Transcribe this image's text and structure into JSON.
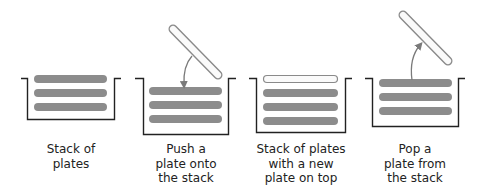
{
  "colors": {
    "plate_fill": "#8c8c8c",
    "new_plate_fill": "#fafafa",
    "new_plate_stroke": "#8a8a8a",
    "container_stroke": "#222222",
    "arrow": "#7a7a7a",
    "text": "#222222"
  },
  "panels": [
    {
      "id": "stack",
      "caption_lines": [
        "Stack of",
        "plates"
      ]
    },
    {
      "id": "push",
      "caption_lines": [
        "Push a",
        "plate onto",
        "the stack"
      ]
    },
    {
      "id": "after-push",
      "caption_lines": [
        "Stack of plates",
        "with a new",
        "plate on top"
      ]
    },
    {
      "id": "pop",
      "caption_lines": [
        "Pop a",
        "plate from",
        "the stack"
      ]
    }
  ]
}
